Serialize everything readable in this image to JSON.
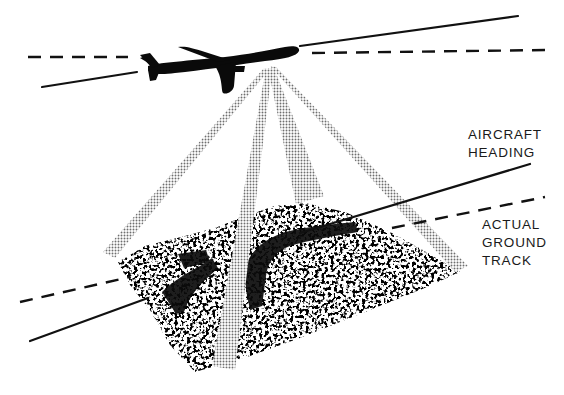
{
  "figure": {
    "labels": {
      "aircraft_heading": [
        "AIRCRAFT",
        "HEADING"
      ],
      "actual_ground_track": [
        "ACTUAL",
        "GROUND",
        "TRACK"
      ]
    },
    "elements": {
      "aircraft": "aircraft-silhouette",
      "beams": 4,
      "terrain": "speckled-terrain-patch",
      "heading_line_style": "solid",
      "ground_track_line_style": "dashed"
    },
    "colors": {
      "ink": "#111111",
      "beam_halftone": "#8a8a8a",
      "background": "#ffffff"
    }
  }
}
